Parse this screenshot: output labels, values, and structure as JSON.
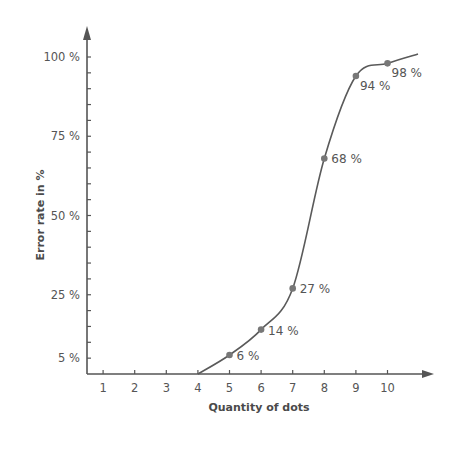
{
  "chart_data": {
    "type": "line",
    "title": "",
    "xlabel": "Quantity of dots",
    "ylabel": "Error rate in %",
    "x_ticks": [
      "1",
      "2",
      "3",
      "4",
      "5",
      "6",
      "7",
      "8",
      "9",
      "10"
    ],
    "y_ticks": [
      "5 %",
      "25 %",
      "50 %",
      "75 %",
      "100 %"
    ],
    "y_tick_values": [
      5,
      25,
      50,
      75,
      100
    ],
    "xlim": [
      0.5,
      11.5
    ],
    "ylim": [
      0,
      105
    ],
    "grid": false,
    "legend": null,
    "series": [
      {
        "name": "Error rate",
        "x": [
          5,
          6,
          7,
          8,
          9,
          10
        ],
        "values": [
          6,
          14,
          27,
          68,
          94,
          98
        ],
        "labels": [
          "6 %",
          "14 %",
          "27 %",
          "68 %",
          "94 %",
          "98 %"
        ]
      }
    ],
    "curve_start": {
      "x": 4,
      "y": 0
    }
  },
  "colors": {
    "axis": "#555555",
    "curve": "#5a5a5a",
    "marker": "#777777",
    "text": "#555555"
  }
}
